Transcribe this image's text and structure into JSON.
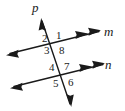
{
  "figure": {
    "type": "geometry-diagram",
    "background_color": "#ffffff",
    "stroke_color": "#1a1a1a",
    "width": 125,
    "height": 111
  },
  "lines": [
    {
      "id": "m",
      "label": "m",
      "label_x": 104,
      "label_y": 25,
      "arrow_start": "single",
      "arrow_end": "double",
      "x1": 8,
      "y1": 54,
      "x2": 100,
      "y2": 31
    },
    {
      "id": "n",
      "label": "n",
      "label_x": 105,
      "label_y": 58,
      "arrow_start": "single",
      "arrow_end": "double",
      "x1": 12,
      "y1": 87,
      "x2": 104,
      "y2": 64
    },
    {
      "id": "p",
      "label": "p",
      "label_x": 32,
      "label_y": 1,
      "arrow_start": "single",
      "arrow_end": "single",
      "x1": 41,
      "y1": 19,
      "x2": 71,
      "y2": 106
    }
  ],
  "intersections": [
    {
      "id": "upper",
      "lines": [
        "m",
        "p"
      ],
      "x": 55,
      "y": 43
    },
    {
      "id": "lower",
      "lines": [
        "n",
        "p"
      ],
      "x": 62,
      "y": 75
    }
  ],
  "angles": [
    {
      "label": "1",
      "x": 56,
      "y": 30,
      "intersection": "upper",
      "position": "upper-right"
    },
    {
      "label": "2",
      "x": 42,
      "y": 33,
      "intersection": "upper",
      "position": "upper-left"
    },
    {
      "label": "3",
      "x": 44,
      "y": 45,
      "intersection": "upper",
      "position": "lower-left"
    },
    {
      "label": "8",
      "x": 59,
      "y": 45,
      "intersection": "upper",
      "position": "lower-right"
    },
    {
      "label": "4",
      "x": 49,
      "y": 62,
      "intersection": "lower",
      "position": "upper-left"
    },
    {
      "label": "7",
      "x": 64,
      "y": 61,
      "intersection": "lower",
      "position": "upper-right"
    },
    {
      "label": "5",
      "x": 53,
      "y": 78,
      "intersection": "lower",
      "position": "lower-left"
    },
    {
      "label": "6",
      "x": 68,
      "y": 77,
      "intersection": "lower",
      "position": "lower-right"
    }
  ]
}
